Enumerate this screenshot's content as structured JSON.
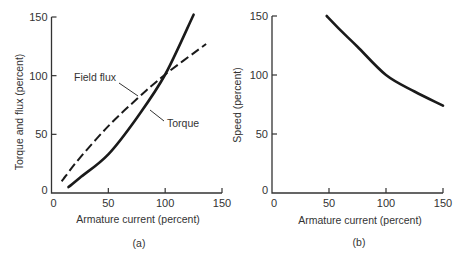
{
  "chart_data": [
    {
      "type": "line",
      "panel_label": "(a)",
      "title": "",
      "xlabel": "Armature current (percent)",
      "ylabel": "Torque and flux (percent)",
      "xlim": [
        0,
        150
      ],
      "ylim": [
        0,
        150
      ],
      "xticks": [
        0,
        50,
        100,
        150
      ],
      "yticks": [
        0,
        50,
        100,
        150
      ],
      "grid": false,
      "legend": "none (curves labeled directly)",
      "series": [
        {
          "name": "Field flux",
          "style": "dashed",
          "x": [
            9,
            25,
            50,
            75,
            100,
            136
          ],
          "y": [
            10,
            30,
            57,
            80,
            101,
            127
          ]
        },
        {
          "name": "Torque",
          "style": "solid",
          "x": [
            15,
            25,
            50,
            75,
            100,
            125
          ],
          "y": [
            5,
            13,
            33,
            64,
            101,
            152
          ]
        }
      ],
      "annotations": [
        "Field flux",
        "Torque"
      ]
    },
    {
      "type": "line",
      "panel_label": "(b)",
      "title": "",
      "xlabel": "Armature current (percent)",
      "ylabel": "Speed (percent)",
      "xlim": [
        0,
        150
      ],
      "ylim": [
        0,
        150
      ],
      "xticks": [
        0,
        50,
        100,
        150
      ],
      "yticks": [
        0,
        50,
        100,
        150
      ],
      "grid": false,
      "series": [
        {
          "name": "Speed",
          "style": "solid",
          "x": [
            48,
            60,
            75,
            100,
            125,
            150
          ],
          "y": [
            150,
            138,
            124,
            100,
            86,
            74
          ]
        }
      ]
    }
  ]
}
